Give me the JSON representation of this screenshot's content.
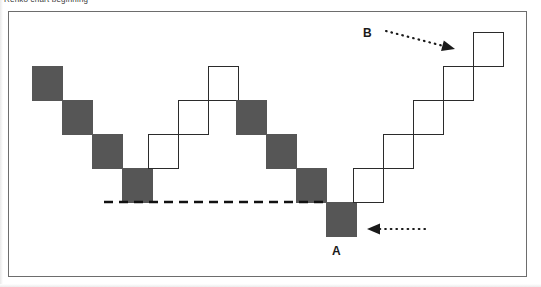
{
  "figure": {
    "caption": "Renko chart beginning",
    "frame": {
      "x": 8,
      "y": 11,
      "width": 519,
      "height": 266,
      "border_color": "#6d6d6d"
    },
    "background_color": "#ffffff"
  },
  "colors": {
    "down_brick_fill": "#565656",
    "up_brick_fill": "#ffffff",
    "up_brick_stroke": "#2b2b2b",
    "support_line": "#111111",
    "annotation": "#1a1a1a"
  },
  "annotations": [
    {
      "label": "A",
      "label_x": 332,
      "label_y": 245,
      "arrow": {
        "x1": 425,
        "y1": 229,
        "x2": 367,
        "y2": 229,
        "style": "dotted",
        "direction": "left"
      },
      "points_to": "lowest-down-brick"
    },
    {
      "label": "B",
      "label_x": 363,
      "label_y": 27,
      "arrow": {
        "x1": 386,
        "y1": 31,
        "x2": 455,
        "y2": 49,
        "style": "dotted",
        "direction": "down-right"
      },
      "points_to": "highest-up-brick"
    }
  ],
  "support_line": {
    "name": "support-level",
    "x1": 104,
    "x2": 327,
    "y": 202,
    "style": "dashed",
    "width": 2.6
  },
  "chart_data": {
    "type": "bar",
    "chart_style": "renko",
    "title": "Renko chart beginning",
    "xlabel": "",
    "ylabel": "",
    "grid": false,
    "legend": null,
    "brick_width": 31,
    "brick_height": 35,
    "categories": [
      "1",
      "2",
      "3",
      "4",
      "5",
      "6",
      "7",
      "8",
      "9",
      "10",
      "11",
      "12",
      "13",
      "14",
      "15",
      "16"
    ],
    "series": [
      {
        "name": "Renko bricks",
        "values": [
          {
            "index": 1,
            "direction": "down",
            "x": 32,
            "y": 66,
            "w": 31,
            "h": 35
          },
          {
            "index": 2,
            "direction": "down",
            "x": 62,
            "y": 100,
            "w": 31,
            "h": 35
          },
          {
            "index": 3,
            "direction": "down",
            "x": 92,
            "y": 134,
            "w": 31,
            "h": 35
          },
          {
            "index": 4,
            "direction": "down",
            "x": 122,
            "y": 168,
            "w": 31,
            "h": 35
          },
          {
            "index": 5,
            "direction": "up",
            "x": 148,
            "y": 134,
            "w": 31,
            "h": 35
          },
          {
            "index": 6,
            "direction": "up",
            "x": 178,
            "y": 100,
            "w": 31,
            "h": 35
          },
          {
            "index": 7,
            "direction": "up",
            "x": 208,
            "y": 66,
            "w": 31,
            "h": 35
          },
          {
            "index": 8,
            "direction": "down",
            "x": 236,
            "y": 100,
            "w": 31,
            "h": 35
          },
          {
            "index": 9,
            "direction": "down",
            "x": 266,
            "y": 134,
            "w": 31,
            "h": 35
          },
          {
            "index": 10,
            "direction": "down",
            "x": 296,
            "y": 168,
            "w": 31,
            "h": 35
          },
          {
            "index": 11,
            "direction": "down",
            "x": 326,
            "y": 202,
            "w": 31,
            "h": 35
          },
          {
            "index": 12,
            "direction": "up",
            "x": 353,
            "y": 168,
            "w": 31,
            "h": 35
          },
          {
            "index": 13,
            "direction": "up",
            "x": 383,
            "y": 134,
            "w": 31,
            "h": 35
          },
          {
            "index": 14,
            "direction": "up",
            "x": 413,
            "y": 100,
            "w": 31,
            "h": 35
          },
          {
            "index": 15,
            "direction": "up",
            "x": 443,
            "y": 66,
            "w": 31,
            "h": 35
          },
          {
            "index": 16,
            "direction": "up",
            "x": 473,
            "y": 32,
            "w": 31,
            "h": 35
          }
        ]
      }
    ]
  }
}
